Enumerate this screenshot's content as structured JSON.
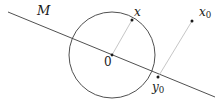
{
  "figure": {
    "kind": "geometry-diagram",
    "background_color": "#ffffff",
    "width": 222,
    "height": 105,
    "labels": {
      "line_label": "M",
      "point_x": "x",
      "point_x0_base": "x",
      "point_x0_sub": "0",
      "point_y0_base": "y",
      "point_y0_sub": "0",
      "center": "0"
    },
    "colors": {
      "stroke_dark": "#3c3c3c",
      "stroke_light": "#b8b8b8",
      "point_fill": "#1a1a1a",
      "text": "#1a1a1a"
    },
    "geometry": {
      "line_M": {
        "x1": 8,
        "y1": 12,
        "x2": 215,
        "y2": 97
      },
      "circle": {
        "cx": 112,
        "cy": 55,
        "r": 43
      },
      "radius_segment": {
        "x1": 112,
        "y1": 55,
        "x2": 132,
        "y2": 20
      },
      "projection_segment": {
        "x1": 158,
        "y1": 77,
        "x2": 192,
        "y2": 21
      },
      "points": [
        {
          "name": "x",
          "cx": 132,
          "cy": 20
        },
        {
          "name": "x0",
          "cx": 192,
          "cy": 21
        },
        {
          "name": "y0",
          "cx": 158,
          "cy": 77
        },
        {
          "name": "center",
          "cx": 112,
          "cy": 55
        }
      ]
    }
  }
}
